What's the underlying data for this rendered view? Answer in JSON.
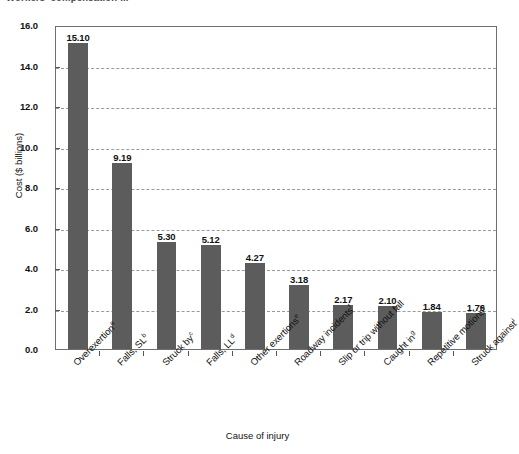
{
  "figure": {
    "clipped_top_title": "Workers' compensation ...",
    "x_axis_title": "Cause of injury",
    "y_axis_title": "Cost ($ billions)"
  },
  "chart_data": {
    "type": "bar",
    "title": "",
    "xlabel": "Cause of injury",
    "ylabel": "Cost ($ billions)",
    "ylim": [
      0.0,
      16.0
    ],
    "ytick_step": 2.0,
    "grid": true,
    "legend": "none",
    "bar_color": "#5c5c5c",
    "categories": [
      "Overexertion",
      "Falls, SL",
      "Struck by",
      "Falls, LL",
      "Other exertions",
      "Roadway incidents",
      "Slip or trip without fall",
      "Caught in",
      "Repetitive motions",
      "Struck against"
    ],
    "category_footnotes": [
      "a",
      "b",
      "c",
      "d",
      "e",
      "f",
      "",
      "g",
      "h",
      "i"
    ],
    "values": [
      15.1,
      9.19,
      5.3,
      5.12,
      4.27,
      3.18,
      2.17,
      2.1,
      1.84,
      1.76
    ],
    "value_labels": [
      "15.10",
      "9.19",
      "5.30",
      "5.12",
      "4.27",
      "3.18",
      "2.17",
      "2.10",
      "1.84",
      "1.76"
    ],
    "ytick_labels": [
      "0.0",
      "2.0",
      "4.0",
      "6.0",
      "8.0",
      "10.0",
      "12.0",
      "14.0",
      "16.0"
    ],
    "ytick_values": [
      0.0,
      2.0,
      4.0,
      6.0,
      8.0,
      10.0,
      12.0,
      14.0,
      16.0
    ]
  }
}
